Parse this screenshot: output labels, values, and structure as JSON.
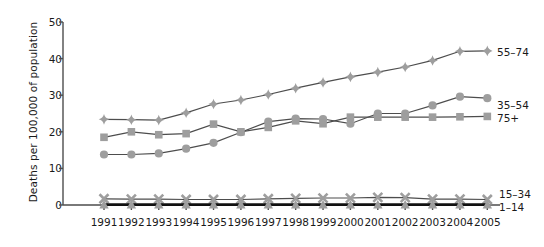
{
  "chart_data": {
    "type": "line",
    "title": "",
    "xlabel": "",
    "ylabel": "Deaths per 100,000 of population",
    "categories": [
      1991,
      1992,
      1993,
      1994,
      1995,
      1996,
      1997,
      1998,
      1999,
      2000,
      2001,
      2002,
      2003,
      2004,
      2005
    ],
    "xticklabels": [
      "1991",
      "1992",
      "1993",
      "1994",
      "1995",
      "1996",
      "1997",
      "1998",
      "1999",
      "2000",
      "2001",
      "2002",
      "2003",
      "2004",
      "2005"
    ],
    "yticklabels": [
      "0",
      "10",
      "20",
      "30",
      "40",
      "50"
    ],
    "ylim": [
      0,
      50
    ],
    "yticks": [
      0,
      10,
      20,
      30,
      40,
      50
    ],
    "grid": false,
    "legend_position": "right-inline",
    "series": [
      {
        "name": "55-74",
        "label": "55–74",
        "marker": "diamond",
        "color": "#9e9e9e",
        "line_color": "#4d4d4d",
        "values": [
          23.4,
          23.3,
          23.2,
          25.2,
          27.6,
          28.7,
          30.2,
          31.9,
          33.5,
          35.0,
          36.3,
          37.7,
          39.5,
          42.0,
          42.1
        ]
      },
      {
        "name": "35-54",
        "label": "35–54",
        "marker": "circle",
        "color": "#9e9e9e",
        "line_color": "#4d4d4d",
        "values": [
          13.8,
          13.8,
          14.1,
          15.4,
          17.0,
          19.9,
          22.8,
          23.6,
          23.5,
          22.2,
          25.0,
          25.0,
          27.2,
          29.6,
          29.2
        ]
      },
      {
        "name": "75+",
        "label": "75+",
        "marker": "square",
        "color": "#9e9e9e",
        "line_color": "#4d4d4d",
        "values": [
          18.5,
          20.0,
          19.2,
          19.5,
          22.1,
          20.0,
          21.2,
          23.0,
          22.2,
          24.0,
          24.0,
          24.0,
          24.0,
          24.1,
          24.2
        ]
      },
      {
        "name": "15-34",
        "label": "15–34",
        "marker": "cross",
        "color": "#9e9e9e",
        "line_color": "#4d4d4d",
        "values": [
          1.7,
          1.6,
          1.6,
          1.5,
          1.5,
          1.5,
          1.7,
          1.8,
          1.9,
          1.9,
          2.1,
          2.0,
          1.6,
          1.6,
          1.5
        ]
      },
      {
        "name": "1-14",
        "label": "1–14",
        "marker": "triangle",
        "color": "#9e9e9e",
        "line_color": "#111111",
        "values": [
          0.1,
          0.1,
          0.1,
          0.1,
          0.1,
          0.1,
          0.1,
          0.1,
          0.1,
          0.1,
          0.1,
          0.1,
          0.1,
          0.1,
          0.1
        ]
      }
    ],
    "series_labels": [
      {
        "text": "55–74",
        "x": 497,
        "y": 52
      },
      {
        "text": "35–54",
        "x": 497,
        "y": 105
      },
      {
        "text": "75+",
        "x": 497,
        "y": 118
      },
      {
        "text": "15–34",
        "x": 499,
        "y": 194
      },
      {
        "text": "1–14",
        "x": 499,
        "y": 207
      }
    ],
    "colors": {
      "marker": "#9e9e9e",
      "line": "#4d4d4d",
      "axis": "#4d4d4d",
      "text": "#1a1a1a",
      "baseline": "#111111",
      "background": "#ffffff"
    }
  }
}
